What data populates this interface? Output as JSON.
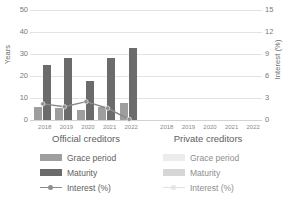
{
  "chart_data": {
    "type": "bar",
    "title": "",
    "subtitle": "",
    "xlabel": "",
    "ylabel": "Years",
    "y2label": "Interest (%)",
    "ylim": [
      0,
      50
    ],
    "y2lim": [
      0,
      15
    ],
    "yticks": [
      "50",
      "40",
      "30",
      "20",
      "10",
      "0"
    ],
    "y2ticks": [
      "15",
      "12",
      "9",
      "6",
      "3",
      "0"
    ],
    "grid": true,
    "legend_position": "bottom",
    "categories": [
      "2018",
      "2019",
      "2020",
      "2021",
      "2022"
    ],
    "panels": [
      {
        "name": "official",
        "label": "Official creditors",
        "categories": [
          "2018",
          "2019",
          "2020",
          "2021",
          "2022"
        ],
        "series": [
          {
            "name": "Grace period",
            "axis": "left",
            "type": "bar",
            "values": [
              6.0,
              5.5,
              4.5,
              6.0,
              7.8
            ]
          },
          {
            "name": "Maturity",
            "axis": "left",
            "type": "bar",
            "values": [
              25.2,
              28.0,
              17.6,
              28.2,
              32.8
            ]
          },
          {
            "name": "Interest (%)",
            "axis": "right",
            "type": "line",
            "values": [
              2.2,
              1.8,
              2.5,
              1.6,
              0.1
            ]
          }
        ]
      },
      {
        "name": "private",
        "label": "Private creditors",
        "categories": [
          "2018",
          "2019",
          "2020",
          "2021",
          "2022"
        ],
        "series": [
          {
            "name": "Grace period",
            "axis": "left",
            "type": "bar",
            "values": [
              0,
              0,
              0,
              0,
              0
            ]
          },
          {
            "name": "Maturity",
            "axis": "left",
            "type": "bar",
            "values": [
              0,
              0,
              0,
              0,
              0
            ]
          },
          {
            "name": "Interest (%)",
            "axis": "right",
            "type": "line",
            "values": [
              null,
              null,
              null,
              null,
              null
            ]
          }
        ]
      }
    ],
    "colors": {
      "official_grace": "#9e9e9e",
      "official_maturity": "#6b6b6b",
      "official_interest": "#8a8a8a",
      "private_grace": "#e8e8e8",
      "private_maturity": "#d9d9d9",
      "private_interest": "#e0e0e0",
      "gridline": "#e3e3e3",
      "text": "#5e5e5e",
      "background": "#ffffff"
    }
  },
  "axes": {
    "left": {
      "title": "Years",
      "ticks": [
        "50",
        "40",
        "30",
        "20",
        "10",
        "0"
      ]
    },
    "right": {
      "title": "Interest (%)",
      "ticks": [
        "15",
        "12",
        "9",
        "6",
        "3",
        "0"
      ]
    }
  },
  "panels": {
    "official": {
      "title": "Official creditors",
      "categories": [
        "2018",
        "2019",
        "2020",
        "2021",
        "2022"
      ]
    },
    "private": {
      "title": "Private creditors",
      "categories": [
        "2018",
        "2019",
        "2020",
        "2021",
        "2022"
      ]
    }
  },
  "legends": {
    "official": [
      {
        "label": "Grace period"
      },
      {
        "label": "Maturity"
      },
      {
        "label": "Interest (%)"
      }
    ],
    "private": [
      {
        "label": "Grace period"
      },
      {
        "label": "Maturity"
      },
      {
        "label": "Interest (%)"
      }
    ]
  }
}
